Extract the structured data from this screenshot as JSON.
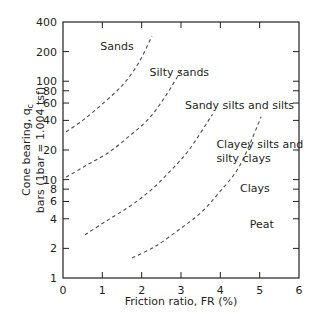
{
  "chart_data": {
    "type": "line",
    "title": "",
    "xlabel": "Friction ratio, FR (%)",
    "ylabel_line1": "Cone bearing, q",
    "ylabel_sub": "c",
    "ylabel_line2": "bars (1bar = 1.004 tsf)",
    "xlim": [
      0,
      6
    ],
    "ylim": [
      1,
      400
    ],
    "yscale": "log",
    "grid": false,
    "x_ticks": [
      0,
      1,
      2,
      3,
      4,
      5,
      6
    ],
    "y_ticks": [
      1,
      2,
      4,
      6,
      8,
      10,
      20,
      40,
      60,
      80,
      100,
      200,
      400
    ],
    "series": [
      {
        "name": "Sands / Silty sands boundary",
        "style": "dashed",
        "x": [
          0.08,
          0.5,
          0.92,
          1.3,
          1.6,
          1.95,
          2.26
        ],
        "y": [
          30.6,
          40,
          55,
          75,
          100,
          160,
          288
        ]
      },
      {
        "name": "Silty sands / Sandy silts boundary",
        "style": "dashed",
        "x": [
          0.08,
          0.6,
          1.17,
          1.7,
          2.19,
          2.6,
          3.0
        ],
        "y": [
          10.6,
          14,
          19,
          28,
          42,
          70,
          128
        ]
      },
      {
        "name": "Sandy silts / Clayey silts boundary",
        "style": "dashed",
        "x": [
          0.56,
          1.1,
          1.68,
          2.2,
          2.7,
          3.2,
          3.8
        ],
        "y": [
          2.75,
          3.8,
          5.3,
          7.6,
          11.9,
          20,
          46
        ]
      },
      {
        "name": "Clayey silts / Clays boundary",
        "style": "dashed",
        "x": [
          1.76,
          2.35,
          2.95,
          3.5,
          3.97,
          4.5,
          5.04
        ],
        "y": [
          1.6,
          2.1,
          3.1,
          4.6,
          7.4,
          14,
          43.6
        ]
      }
    ],
    "annotations": [
      {
        "text": "Sands",
        "x": 0.95,
        "y": 230
      },
      {
        "text": "Silty sands",
        "x": 2.2,
        "y": 125
      },
      {
        "text": "Sandy silts and silts",
        "x": 3.1,
        "y": 58
      },
      {
        "text": "Clayey silts and",
        "x": 3.9,
        "y": 23
      },
      {
        "text": "silty clays",
        "x": 3.9,
        "y": 16.5
      },
      {
        "text": "Clays",
        "x": 4.5,
        "y": 8.2
      },
      {
        "text": "Peat",
        "x": 4.75,
        "y": 3.5
      }
    ]
  },
  "colors": {
    "axis": "#231f20",
    "curve": "#4d4d4f",
    "text": "#231f20"
  }
}
